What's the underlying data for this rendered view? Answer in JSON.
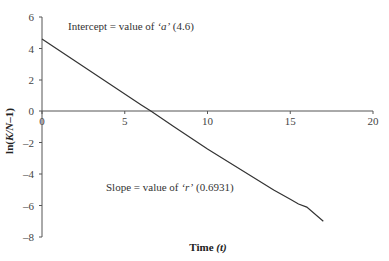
{
  "chart_data": {
    "type": "line",
    "title": "",
    "xlabel": "Time (t)",
    "ylabel": "ln(K/N-1)",
    "xlim": [
      0,
      20
    ],
    "ylim": [
      -8,
      6
    ],
    "x_ticks": [
      0,
      5,
      10,
      15,
      20
    ],
    "y_ticks": [
      6,
      4,
      2,
      0,
      -2,
      -4,
      -6,
      -8
    ],
    "grid": false,
    "legend": null,
    "series": [
      {
        "name": "ln(K/N-1)",
        "x": [
          0,
          2,
          4,
          6,
          6.6,
          8,
          10,
          12,
          14,
          15,
          15.5,
          16,
          17
        ],
        "y": [
          4.6,
          3.2,
          1.8,
          0.4,
          0.0,
          -1.0,
          -2.4,
          -3.7,
          -5.0,
          -5.6,
          -5.9,
          -6.1,
          -7.0
        ]
      }
    ],
    "annotations": [
      {
        "text_prefix": "Intercept = value of ",
        "symbol": "‘a’",
        "text_suffix": " (4.6)",
        "value": 4.6
      },
      {
        "text_prefix": "Slope = value of ",
        "symbol": "‘r’",
        "text_suffix": " (0.6931)",
        "value": 0.6931
      }
    ]
  },
  "labels": {
    "xlabel_main": "Time ",
    "xlabel_var": "(t)",
    "ylabel_prefix": "ln(",
    "ylabel_var": "K/N",
    "ylabel_suffix": "–1)",
    "x_ticks": [
      "0",
      "5",
      "10",
      "15",
      "20"
    ],
    "y_ticks": [
      "6",
      "4",
      "2",
      "0",
      "–2",
      "–4",
      "–6",
      "–8"
    ],
    "intercept_prefix": "Intercept = value of ",
    "intercept_symbol": "‘a’",
    "intercept_suffix": " (4.6)",
    "slope_prefix": "Slope = value of ",
    "slope_symbol": "‘r’",
    "slope_suffix": " (0.6931)"
  },
  "colors": {
    "line": "#333333",
    "axis": "#555555"
  }
}
